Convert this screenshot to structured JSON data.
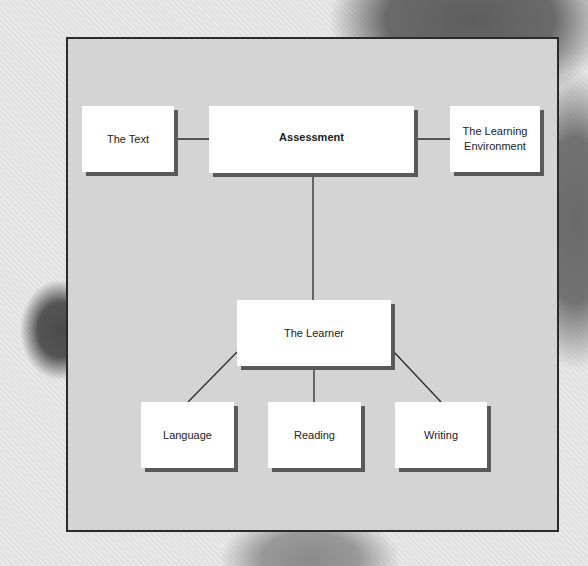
{
  "diagram": {
    "type": "hierarchy",
    "colors": {
      "frame_fill": "#d4d4d4",
      "frame_border": "#2a2a2a",
      "box_fill": "#ffffff",
      "box_shadow": "#5a5a5a",
      "line": "#2a2a2a",
      "text": "#222222"
    },
    "nodes": [
      {
        "id": "text",
        "label": "The Text"
      },
      {
        "id": "assessment",
        "label": "Assessment"
      },
      {
        "id": "environment",
        "label": "The Learning\nEnvironment"
      },
      {
        "id": "learner",
        "label": "The Learner"
      },
      {
        "id": "language",
        "label": "Language"
      },
      {
        "id": "reading",
        "label": "Reading"
      },
      {
        "id": "writing",
        "label": "Writing"
      }
    ],
    "edges": [
      {
        "from": "assessment",
        "to": "text"
      },
      {
        "from": "assessment",
        "to": "environment"
      },
      {
        "from": "assessment",
        "to": "learner"
      },
      {
        "from": "learner",
        "to": "language"
      },
      {
        "from": "learner",
        "to": "reading"
      },
      {
        "from": "learner",
        "to": "writing"
      }
    ]
  }
}
